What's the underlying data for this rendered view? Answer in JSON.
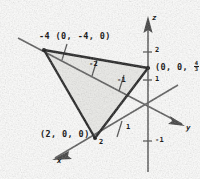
{
  "figure": {
    "background_color": "#fdfdfc",
    "ink_color": "#1d1d1d",
    "shade_color": "#ebebe8"
  },
  "axes": [
    {
      "name": "z-axis",
      "label": "z",
      "direction": "up"
    },
    {
      "name": "y-axis",
      "label": "y",
      "direction": "right-down"
    },
    {
      "name": "x-axis",
      "label": "x",
      "direction": "left-down"
    }
  ],
  "axis_labels": {
    "z": "z",
    "y": "y",
    "x": "x"
  },
  "ticks": {
    "z_axis": [
      {
        "label": "2",
        "value": 2
      },
      {
        "label": "1",
        "value": 1
      }
    ],
    "y_axis": [
      {
        "label": "-2",
        "value": -2
      },
      {
        "label": "-1",
        "value": -1
      },
      {
        "label": "1",
        "value": 1
      },
      {
        "label": "-1",
        "value": -1
      }
    ],
    "x_axis": [
      {
        "label": "2",
        "value": 2
      }
    ]
  },
  "tick_values": {
    "z2": "2",
    "z1": "1",
    "y_neg2": "-2",
    "y_neg1": "-1",
    "y_pos1": "1",
    "y_below_origin_neg1": "-1",
    "x2": "2"
  },
  "vertices": [
    {
      "name": "y-intercept",
      "tick": "-4",
      "label": "(0, -4, 0)",
      "coords": [
        0,
        -4,
        0
      ]
    },
    {
      "name": "z-intercept",
      "label_prefix": "(0, 0, ",
      "fraction_numerator": "4",
      "fraction_denominator": "3",
      "label_suffix": ")",
      "coords": [
        0,
        0,
        1.3333
      ]
    },
    {
      "name": "x-intercept",
      "label": "(2, 0, 0)",
      "tick": "2",
      "coords": [
        2,
        0,
        0
      ]
    }
  ],
  "labels": {
    "vertex_y": "-4 (0, -4, 0)",
    "vertex_y_tick": "-4",
    "vertex_y_coords": "(0, -4, 0)",
    "vertex_x_coords": "(2, 0, 0)",
    "vertex_z_open": "(0, 0, ",
    "vertex_z_num": "4",
    "vertex_z_den": "3",
    "vertex_z_close": ")"
  }
}
